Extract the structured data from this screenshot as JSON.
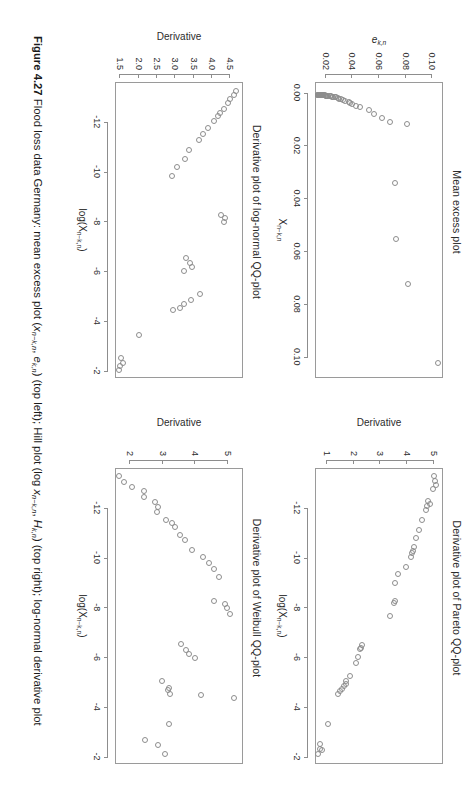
{
  "page": {
    "orientation": "rotated-90-clockwise",
    "background": "#ffffff",
    "ink": "#231f20"
  },
  "caption": {
    "figure_number": "Figure 4.27",
    "text_plain": "Flood loss data Germany: mean excess plot (x n−k,n , e k,n ) (top left); Hill plot (log x n−k,n , H k,n ) (top right); log-normal derivative plot",
    "seg1": "Flood loss data Germany: mean excess plot (",
    "sym1_base": "x",
    "sym1_sub": "n−k,n",
    "seg2": ", ",
    "sym2_base": "e",
    "sym2_sub": "k,n",
    "seg3": ") (top left); Hill plot (log ",
    "sym3_base": "x",
    "sym3_sub": "n−k,n",
    "seg4": ", ",
    "sym4_base": "H",
    "sym4_sub": "k,n",
    "seg5": ") (top right); log-normal derivative plot"
  },
  "chart_data": [
    {
      "id": "mean-excess-plot",
      "position": "top-left",
      "type": "scatter",
      "title": "Mean excess plot",
      "xlabel": "X n−k,n",
      "xlabel_base": "X",
      "xlabel_sub": "n−k,n",
      "ylabel": "e k,n",
      "ylabel_base": "e",
      "ylabel_sub": "k,n",
      "xlim": [
        -0.004,
        0.108
      ],
      "ylim": [
        0.012,
        0.108
      ],
      "xticks": [
        0.0,
        0.02,
        0.04,
        0.06,
        0.08,
        0.1
      ],
      "xticklabels": [
        "0.00",
        "0.02",
        "0.04",
        "0.06",
        "0.08",
        "0.10"
      ],
      "yticks": [
        0.02,
        0.04,
        0.06,
        0.08,
        0.1
      ],
      "yticklabels": [
        "0.02",
        "0.04",
        "0.06",
        "0.08",
        "0.10"
      ],
      "grid": false,
      "legend": "none",
      "points": [
        [
          0.1015,
          0.1055
        ],
        [
          0.0715,
          0.0832
        ],
        [
          0.0545,
          0.0742
        ],
        [
          0.0335,
          0.0738
        ],
        [
          0.0113,
          0.0828
        ],
        [
          0.0103,
          0.07
        ],
        [
          0.0088,
          0.064
        ],
        [
          0.0072,
          0.0575
        ],
        [
          0.006,
          0.054
        ],
        [
          0.0048,
          0.047
        ],
        [
          0.0042,
          0.044
        ],
        [
          0.0035,
          0.0415
        ],
        [
          0.0031,
          0.04
        ],
        [
          0.0027,
          0.0392
        ],
        [
          0.0023,
          0.036
        ],
        [
          0.002,
          0.0345
        ],
        [
          0.0017,
          0.033
        ],
        [
          0.0015,
          0.0318
        ],
        [
          0.0013,
          0.0305
        ],
        [
          0.0011,
          0.0293
        ],
        [
          0.001,
          0.0283
        ],
        [
          0.0009,
          0.0272
        ],
        [
          0.0008,
          0.0262
        ],
        [
          0.0007,
          0.0252
        ],
        [
          0.0006,
          0.0244
        ],
        [
          0.00055,
          0.0236
        ],
        [
          0.0005,
          0.0228
        ],
        [
          0.00045,
          0.0221
        ],
        [
          0.0004,
          0.0214
        ],
        [
          0.00035,
          0.0208
        ],
        [
          0.0003,
          0.0202
        ],
        [
          0.00026,
          0.0196
        ],
        [
          0.00022,
          0.0191
        ],
        [
          0.00019,
          0.0186
        ],
        [
          0.00016,
          0.0182
        ],
        [
          0.00013,
          0.0178
        ],
        [
          0.00011,
          0.0175
        ],
        [
          9e-05,
          0.0172
        ],
        [
          7e-05,
          0.0169
        ],
        [
          5e-05,
          0.0166
        ],
        [
          4e-05,
          0.0164
        ],
        [
          3e-05,
          0.0162
        ],
        [
          2e-05,
          0.016
        ],
        [
          1e-05,
          0.0158
        ],
        [
          5e-06,
          0.0157
        ],
        [
          2e-06,
          0.0156
        ]
      ]
    },
    {
      "id": "pareto-qq-derivative-plot",
      "position": "top-right",
      "type": "scatter",
      "title": "Derivative plot of Pareto QQ-plot",
      "xlabel": "log(X n−k,n )",
      "xlabel_pre": "log(X",
      "xlabel_sub": "n−k,n",
      "xlabel_post": ")",
      "ylabel": "Derivative",
      "xlim": [
        -13.6,
        -1.7
      ],
      "ylim": [
        0.55,
        5.35
      ],
      "xticks": [
        -12,
        -10,
        -8,
        -6,
        -4,
        -2
      ],
      "xticklabels": [
        "-12",
        "-10",
        "-8",
        "-6",
        "-4",
        "-2"
      ],
      "yticks": [
        1,
        2,
        3,
        4,
        5
      ],
      "yticklabels": [
        "1",
        "2",
        "3",
        "4",
        "5"
      ],
      "grid": false,
      "legend": "none",
      "points": [
        [
          -13.35,
          5.08
        ],
        [
          -13.15,
          5.12
        ],
        [
          -13.0,
          5.15
        ],
        [
          -12.85,
          5.05
        ],
        [
          -12.35,
          4.88
        ],
        [
          -12.25,
          4.92
        ],
        [
          -12.15,
          4.82
        ],
        [
          -12.0,
          4.8
        ],
        [
          -11.6,
          4.62
        ],
        [
          -11.2,
          4.52
        ],
        [
          -10.85,
          4.4
        ],
        [
          -10.5,
          4.32
        ],
        [
          -10.35,
          4.3
        ],
        [
          -10.25,
          4.28
        ],
        [
          -10.1,
          4.22
        ],
        [
          -9.7,
          4.02
        ],
        [
          -9.4,
          3.72
        ],
        [
          -9.05,
          3.62
        ],
        [
          -8.35,
          3.62
        ],
        [
          -8.25,
          3.58
        ],
        [
          -7.75,
          3.42
        ],
        [
          -6.55,
          2.38
        ],
        [
          -6.45,
          2.35
        ],
        [
          -6.4,
          2.3
        ],
        [
          -6.1,
          2.22
        ],
        [
          -5.85,
          2.18
        ],
        [
          -5.3,
          1.92
        ],
        [
          -5.1,
          1.8
        ],
        [
          -5.0,
          1.78
        ],
        [
          -4.9,
          1.7
        ],
        [
          -4.8,
          1.62
        ],
        [
          -4.7,
          1.55
        ],
        [
          -4.6,
          1.48
        ],
        [
          -3.4,
          1.12
        ],
        [
          -2.6,
          0.8
        ],
        [
          -2.4,
          0.8
        ],
        [
          -2.35,
          0.88
        ],
        [
          -2.2,
          0.72
        ]
      ]
    },
    {
      "id": "lognormal-qq-derivative-plot",
      "position": "bottom-left",
      "type": "scatter",
      "title": "Derivative plot of log-normal QQ-plot",
      "xlabel": "log(X n−k,n )",
      "xlabel_pre": "log(X",
      "xlabel_sub": "n−k,n",
      "xlabel_post": ")",
      "ylabel": "Derivative",
      "xlim": [
        -13.6,
        -1.7
      ],
      "ylim": [
        1.35,
        4.85
      ],
      "xticks": [
        -12,
        -10,
        -8,
        -6,
        -4,
        -2
      ],
      "xticklabels": [
        "-12",
        "-10",
        "-8",
        "-6",
        "-4",
        "-2"
      ],
      "yticks": [
        1.5,
        2.0,
        2.5,
        3.0,
        3.5,
        4.0,
        4.5
      ],
      "yticklabels": [
        "1.5",
        "2.0",
        "2.5",
        "3.0",
        "3.5",
        "4.0",
        "4.5"
      ],
      "grid": false,
      "legend": "none",
      "points": [
        [
          -13.3,
          4.72
        ],
        [
          -13.15,
          4.65
        ],
        [
          -13.0,
          4.55
        ],
        [
          -12.85,
          4.5
        ],
        [
          -12.6,
          4.38
        ],
        [
          -12.45,
          4.28
        ],
        [
          -12.3,
          4.22
        ],
        [
          -12.1,
          4.12
        ],
        [
          -11.85,
          3.95
        ],
        [
          -11.6,
          3.8
        ],
        [
          -11.35,
          3.7
        ],
        [
          -10.95,
          3.42
        ],
        [
          -10.6,
          3.32
        ],
        [
          -10.25,
          3.1
        ],
        [
          -9.9,
          2.95
        ],
        [
          -8.35,
          4.3
        ],
        [
          -8.2,
          4.42
        ],
        [
          -8.05,
          4.38
        ],
        [
          -6.6,
          3.35
        ],
        [
          -6.4,
          3.45
        ],
        [
          -6.25,
          3.5
        ],
        [
          -6.1,
          3.3
        ],
        [
          -5.15,
          3.72
        ],
        [
          -4.9,
          3.48
        ],
        [
          -4.75,
          3.3
        ],
        [
          -4.6,
          3.18
        ],
        [
          -4.5,
          2.98
        ],
        [
          -3.5,
          2.05
        ],
        [
          -2.6,
          1.58
        ],
        [
          -2.4,
          1.62
        ],
        [
          -2.25,
          1.55
        ],
        [
          -2.1,
          1.52
        ]
      ]
    },
    {
      "id": "weibull-qq-derivative-plot",
      "position": "bottom-right",
      "type": "scatter",
      "title": "Derivative plot of Weibull QQ-plot",
      "xlabel": "log(X n−k,n )",
      "xlabel_pre": "log(X",
      "xlabel_sub": "n−k,n",
      "xlabel_post": ")",
      "ylabel": "Derivative",
      "xlim": [
        -13.6,
        -1.7
      ],
      "ylim": [
        1.55,
        5.45
      ],
      "xticks": [
        -12,
        -10,
        -8,
        -6,
        -4,
        -2
      ],
      "xticklabels": [
        "-12",
        "-10",
        "-8",
        "-6",
        "-4",
        "-2"
      ],
      "yticks": [
        2,
        3,
        4,
        5
      ],
      "yticklabels": [
        "2",
        "3",
        "4",
        "5"
      ],
      "grid": false,
      "legend": "none",
      "points": [
        [
          -13.35,
          1.72
        ],
        [
          -13.1,
          1.88
        ],
        [
          -12.9,
          2.12
        ],
        [
          -12.75,
          2.5
        ],
        [
          -12.5,
          2.5
        ],
        [
          -12.3,
          2.82
        ],
        [
          -12.1,
          2.92
        ],
        [
          -11.9,
          2.88
        ],
        [
          -11.6,
          3.18
        ],
        [
          -11.45,
          3.35
        ],
        [
          -11.3,
          3.45
        ],
        [
          -11.0,
          3.6
        ],
        [
          -10.8,
          3.75
        ],
        [
          -10.4,
          3.95
        ],
        [
          -10.1,
          4.28
        ],
        [
          -9.85,
          4.48
        ],
        [
          -9.6,
          4.62
        ],
        [
          -9.3,
          4.78
        ],
        [
          -8.35,
          4.62
        ],
        [
          -8.2,
          4.95
        ],
        [
          -8.05,
          5.02
        ],
        [
          -7.8,
          5.12
        ],
        [
          -6.6,
          3.62
        ],
        [
          -6.35,
          3.78
        ],
        [
          -6.2,
          3.88
        ],
        [
          -6.05,
          4.05
        ],
        [
          -5.1,
          3.05
        ],
        [
          -4.85,
          3.25
        ],
        [
          -4.75,
          3.22
        ],
        [
          -4.6,
          3.3
        ],
        [
          -4.55,
          4.22
        ],
        [
          -4.45,
          5.25
        ],
        [
          -3.4,
          3.25
        ],
        [
          -2.75,
          2.52
        ],
        [
          -2.55,
          2.92
        ],
        [
          -2.2,
          3.12
        ]
      ]
    }
  ]
}
